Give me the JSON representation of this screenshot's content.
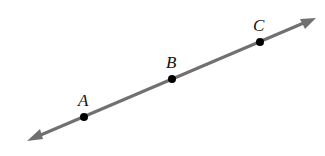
{
  "diagram": {
    "type": "line-with-points",
    "line_color": "#707070",
    "point_color": "#000000",
    "points": [
      {
        "label": "A",
        "x": 84,
        "y": 117
      },
      {
        "label": "B",
        "x": 172,
        "y": 79
      },
      {
        "label": "C",
        "x": 260,
        "y": 42
      }
    ],
    "arrow_ends": {
      "start": {
        "x": 27,
        "y": 141
      },
      "end": {
        "x": 316,
        "y": 18
      }
    }
  }
}
